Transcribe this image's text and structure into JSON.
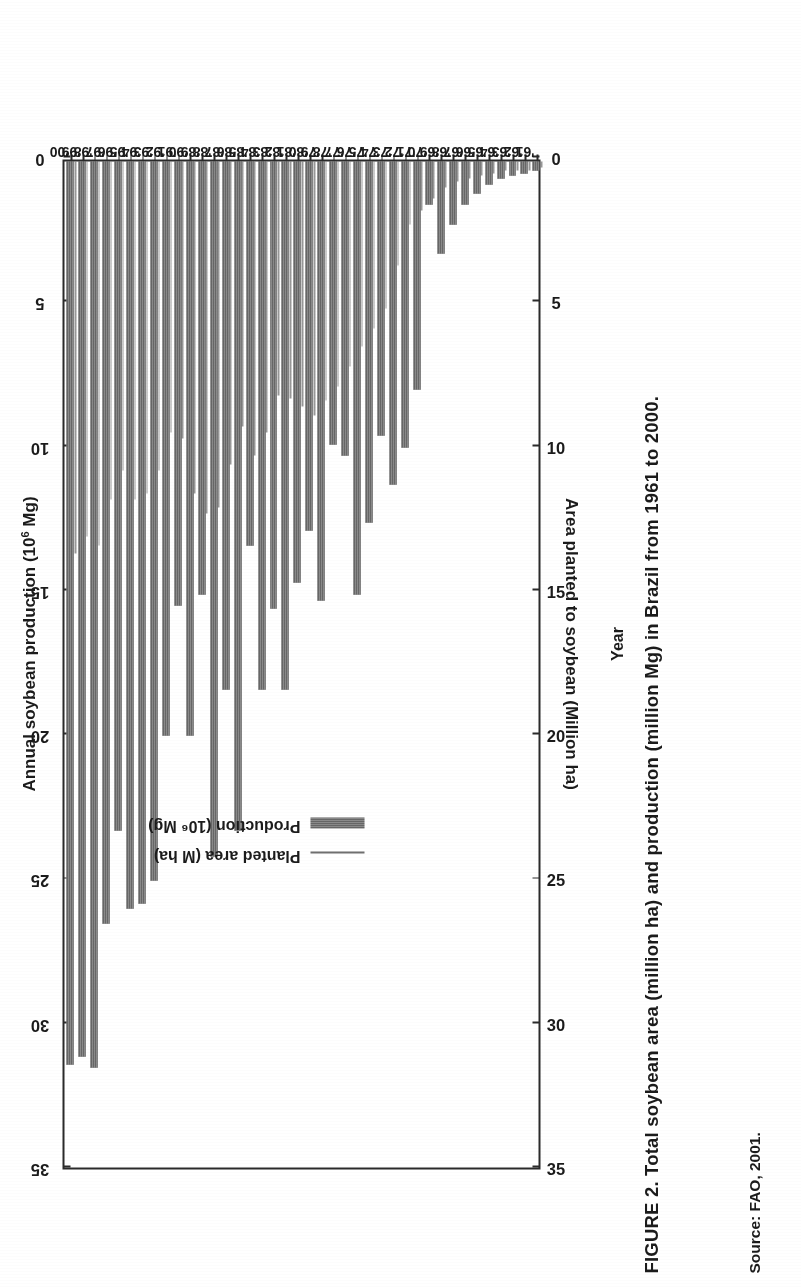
{
  "figure": {
    "caption": "FIGURE 2. Total soybean area (million ha) and production (million Mg) in Brazil from 1961 to 2000.",
    "source": "Source: FAO, 2001."
  },
  "axes": {
    "top_title": "Annual soybean production (10",
    "top_title_sup": "6",
    "top_title_tail": " Mg)",
    "bottom_title": "Area planted to soybean (Million ha)",
    "category_title": "Year",
    "tick_labels": [
      "35",
      "30",
      "25",
      "20",
      "15",
      "10",
      "5",
      "0"
    ],
    "tick_values": [
      35,
      30,
      25,
      20,
      15,
      10,
      5,
      0
    ],
    "value_max": 35,
    "value_min": 0
  },
  "legend": {
    "position": "inside-left",
    "items": [
      {
        "label": "Planted area (M ha)",
        "marker": "line",
        "color": "#6f6f6f"
      },
      {
        "label": "Production (10⁶ Mg)",
        "marker": "bar",
        "color": "#7d7d7d"
      }
    ]
  },
  "colors": {
    "bar": "#7d7d7d",
    "line": "#6f6f6f",
    "axis": "#2a2a2a",
    "text": "#1b1b1b",
    "background": "#ffffff"
  },
  "chart_data": {
    "type": "bar",
    "orientation": "horizontal",
    "title": "FIGURE 2. Total soybean area (million ha) and production (million Mg) in Brazil from 1961 to 2000.",
    "xlabel": "Annual soybean production (10⁶ Mg)",
    "xlabel_secondary": "Area planted to soybean (Million ha)",
    "ylabel": "Year",
    "xlim": [
      0,
      35
    ],
    "grid": false,
    "legend_position": "inside-left",
    "categories": [
      "'00",
      "'99",
      "'98",
      "'97",
      "'96",
      "'95",
      "'94",
      "'93",
      "'92",
      "'91",
      "'90",
      "'89",
      "'88",
      "'87",
      "'86",
      "'85",
      "'84",
      "'83",
      "'82",
      "'81",
      "'80",
      "'79",
      "'78",
      "'77",
      "'76",
      "'75",
      "'74",
      "'73",
      "'72",
      "'71",
      "'70",
      "'69",
      "'68",
      "'67",
      "'66",
      "'65",
      "'64",
      "'63",
      "'62",
      "'61"
    ],
    "series": [
      {
        "name": "Production (10⁶ Mg)",
        "unit": "10^6 Mg",
        "values": [
          31.3,
          31.0,
          31.4,
          26.4,
          23.2,
          25.9,
          25.7,
          24.9,
          19.9,
          15.4,
          19.9,
          15.0,
          24.1,
          18.3,
          23.2,
          13.3,
          18.3,
          15.5,
          18.3,
          14.6,
          12.8,
          15.2,
          9.8,
          10.2,
          15.0,
          12.5,
          9.5,
          11.2,
          9.9,
          7.9,
          1.5,
          3.2,
          2.2,
          1.5,
          1.1,
          0.8,
          0.6,
          0.5,
          0.4,
          0.3
        ]
      },
      {
        "name": "Planted area (M ha)",
        "unit": "million ha",
        "values": [
          13.6,
          13.0,
          13.3,
          11.7,
          10.7,
          11.7,
          11.5,
          10.7,
          9.4,
          9.6,
          11.5,
          12.2,
          12.0,
          10.5,
          9.2,
          10.2,
          9.4,
          8.1,
          8.2,
          8.5,
          8.8,
          8.3,
          7.8,
          7.1,
          6.4,
          5.8,
          5.1,
          3.6,
          2.2,
          1.7,
          1.3,
          0.9,
          0.7,
          0.6,
          0.5,
          0.4,
          0.3,
          0.3,
          0.3,
          0.2
        ]
      }
    ]
  }
}
